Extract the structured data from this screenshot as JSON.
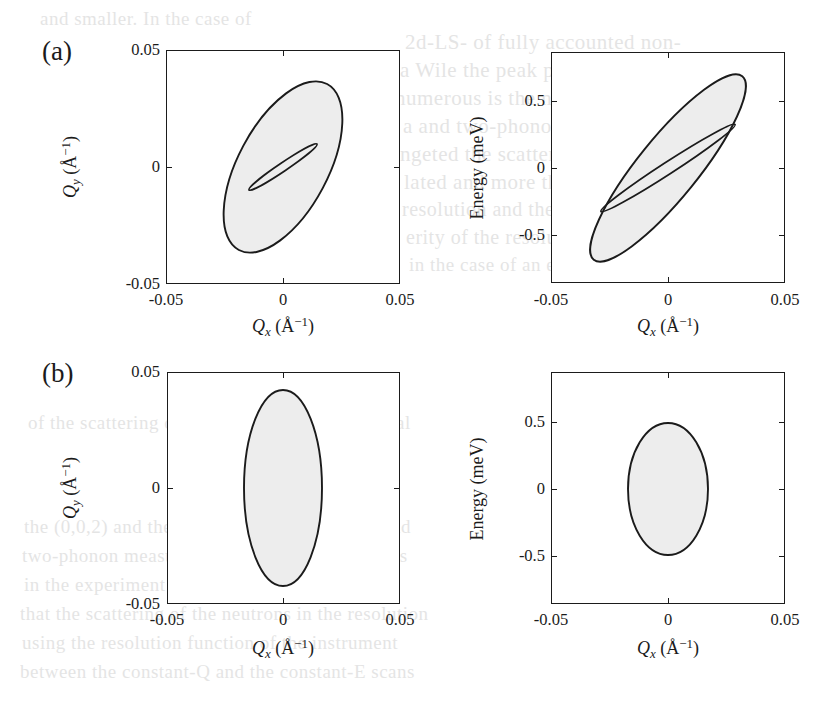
{
  "figure": {
    "background_color": "#ffffff",
    "line_color": "#1b1b1b",
    "fill_color": "#ededed",
    "panels": [
      {
        "tag": "(a)",
        "plots": [
          {
            "id": "a-left",
            "xlabel_var": "Q",
            "xlabel_sub": "x",
            "xlabel_unit_open": " (Å",
            "xlabel_unit_sup": "−1",
            "xlabel_unit_close": ")",
            "ylabel_var": "Q",
            "ylabel_sub": "y",
            "ylabel_unit_open": " (Å",
            "ylabel_unit_sup": "−1",
            "ylabel_unit_close": ")",
            "xticks": [
              "-0.05",
              "0",
              "0.05"
            ],
            "yticks": [
              "0.05",
              "0",
              "-0.05"
            ]
          },
          {
            "id": "a-right",
            "xlabel_var": "Q",
            "xlabel_sub": "x",
            "xlabel_unit_open": " (Å",
            "xlabel_unit_sup": "−1",
            "xlabel_unit_close": ")",
            "ylabel_plain": "Energy (meV)",
            "xticks": [
              "-0.05",
              "0",
              "0.05"
            ],
            "yticks": [
              "0.5",
              "0",
              "-0.5"
            ]
          }
        ]
      },
      {
        "tag": "(b)",
        "plots": [
          {
            "id": "b-left",
            "xlabel_var": "Q",
            "xlabel_sub": "x",
            "xlabel_unit_open": " (Å",
            "xlabel_unit_sup": "−1",
            "xlabel_unit_close": ")",
            "ylabel_var": "Q",
            "ylabel_sub": "y",
            "ylabel_unit_open": " (Å",
            "ylabel_unit_sup": "−1",
            "ylabel_unit_close": ")",
            "xticks": [
              "-0.05",
              "0",
              "0.05"
            ],
            "yticks": [
              "0.05",
              "0",
              "-0.05"
            ]
          },
          {
            "id": "b-right",
            "xlabel_var": "Q",
            "xlabel_sub": "x",
            "xlabel_unit_open": " (Å",
            "xlabel_unit_sup": "−1",
            "xlabel_unit_close": ")",
            "ylabel_plain": "Energy (meV)",
            "xticks": [
              "-0.05",
              "0",
              "0.05"
            ],
            "yticks": [
              "0.5",
              "0",
              "-0.5"
            ]
          }
        ]
      }
    ]
  },
  "chart_data": [
    {
      "id": "a-left",
      "type": "scatter",
      "title": "(a) Q_x - Q_y resolution ellipse",
      "xlabel": "Q_x (Å⁻¹)",
      "ylabel": "Q_y (Å⁻¹)",
      "xlim": [
        -0.05,
        0.05
      ],
      "ylim": [
        -0.05,
        0.05
      ],
      "xticks": [
        -0.05,
        0,
        0.05
      ],
      "yticks": [
        -0.05,
        0,
        0.05
      ],
      "grid": false,
      "legend": null,
      "ellipses": [
        {
          "name": "outer-resolution-ellipse",
          "center": [
            0.0,
            0.0
          ],
          "semi_major": 0.04,
          "semi_minor": 0.019,
          "angle_deg": 118,
          "filled": true
        },
        {
          "name": "inner-sliver-ellipse",
          "center": [
            0.0,
            0.0
          ],
          "semi_major": 0.0175,
          "semi_minor": 0.0016,
          "angle_deg": 146,
          "filled": false
        }
      ]
    },
    {
      "id": "a-right",
      "type": "scatter",
      "title": "(a) Q_x - Energy resolution ellipse",
      "xlabel": "Q_x (Å⁻¹)",
      "ylabel": "Energy (meV)",
      "xlim": [
        -0.05,
        0.05
      ],
      "ylim": [
        -0.75,
        0.75
      ],
      "xticks": [
        -0.05,
        0,
        0.05
      ],
      "yticks": [
        -0.5,
        0,
        0.5
      ],
      "grid": false,
      "legend": null,
      "ellipses": [
        {
          "name": "outer-resolution-ellipse",
          "center": [
            0.0,
            0.0
          ],
          "semi_major_px": 118,
          "semi_minor_px": 30,
          "angle_deg": -51,
          "filled": true
        },
        {
          "name": "inner-sliver-ellipse",
          "center": [
            0.0,
            0.0
          ],
          "semi_major_px": 80,
          "semi_minor_px": 6,
          "angle_deg": -33,
          "filled": false
        }
      ]
    },
    {
      "id": "b-left",
      "type": "scatter",
      "title": "(b) Q_x - Q_y resolution ellipse",
      "xlabel": "Q_x (Å⁻¹)",
      "ylabel": "Q_y (Å⁻¹)",
      "xlim": [
        -0.05,
        0.05
      ],
      "ylim": [
        -0.05,
        0.05
      ],
      "xticks": [
        -0.05,
        0,
        0.05
      ],
      "yticks": [
        -0.05,
        0,
        0.05
      ],
      "grid": false,
      "legend": null,
      "ellipses": [
        {
          "name": "resolution-ellipse",
          "center": [
            0.0,
            0.0
          ],
          "semi_major": 0.042,
          "semi_minor": 0.0168,
          "angle_deg": 90,
          "filled": true
        }
      ]
    },
    {
      "id": "b-right",
      "type": "scatter",
      "title": "(b) Q_x - Energy resolution ellipse",
      "xlabel": "Q_x (Å⁻¹)",
      "ylabel": "Energy (meV)",
      "xlim": [
        -0.05,
        0.05
      ],
      "ylim": [
        -0.75,
        0.75
      ],
      "xticks": [
        -0.05,
        0,
        0.05
      ],
      "yticks": [
        -0.5,
        0,
        0.5
      ],
      "grid": false,
      "legend": null,
      "ellipses": [
        {
          "name": "resolution-ellipse",
          "center": [
            0.0,
            0.0
          ],
          "semi_major": 0.44,
          "semi_minor": 0.0172,
          "angle_deg": 90,
          "filled": true
        }
      ]
    }
  ],
  "background_text": {
    "lines": [
      {
        "text": "and smaller. In the case of",
        "x": 40,
        "y": 8,
        "size": 19
      },
      {
        "text": "2d-LS- of fully accounted non-",
        "x": 405,
        "y": 30,
        "size": 21
      },
      {
        "text": "a Wile the peak positions this",
        "x": 400,
        "y": 58,
        "size": 21
      },
      {
        "text": "numerous is the new term and",
        "x": 395,
        "y": 86,
        "size": 21
      },
      {
        "text": "a and two-phonon scattering",
        "x": 403,
        "y": 114,
        "size": 21
      },
      {
        "text": "ngeted the scattering function",
        "x": 400,
        "y": 142,
        "size": 21
      },
      {
        "text": "lated and more than the used",
        "x": 404,
        "y": 170,
        "size": 21
      },
      {
        "text": "resolution and the two-phonon",
        "x": 402,
        "y": 198,
        "size": 20
      },
      {
        "text": "erity of the resolution gives",
        "x": 406,
        "y": 226,
        "size": 20
      },
      {
        "text": "in the case of an extended",
        "x": 409,
        "y": 254,
        "size": 19
      },
      {
        "text": "of the scattering of neutrons is the instrumental",
        "x": 28,
        "y": 412,
        "size": 19
      },
      {
        "text": "the (0,0,2) and the (1,1,0) Bragg reflections and",
        "x": 24,
        "y": 516,
        "size": 19
      },
      {
        "text": "two-phonon measured and the constant-Q scans",
        "x": 22,
        "y": 545,
        "size": 19
      },
      {
        "text": "in the experiment and the computed from the",
        "x": 24,
        "y": 574,
        "size": 19
      },
      {
        "text": "that the scattering of the neutrons in the resolution",
        "x": 20,
        "y": 603,
        "size": 19
      },
      {
        "text": "using the resolution function of the instrument",
        "x": 22,
        "y": 632,
        "size": 19
      },
      {
        "text": "between the constant-Q and the constant-E scans",
        "x": 20,
        "y": 661,
        "size": 19
      }
    ]
  }
}
